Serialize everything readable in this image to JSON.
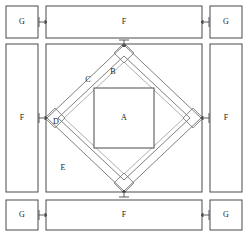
{
  "diagram": {
    "stroke_color": "#4a4a4a",
    "accent_color": "#8a8a8a",
    "background_color": "#ffffff",
    "regions": [
      {
        "id": "A",
        "label": "A",
        "role": "inner-square",
        "x": 124,
        "y": 118
      },
      {
        "id": "B",
        "label": "B",
        "role": "triangle-upper",
        "x": 113,
        "y": 72
      },
      {
        "id": "C",
        "label": "C",
        "role": "band-segment",
        "x": 88,
        "y": 80
      },
      {
        "id": "D",
        "label": "D",
        "role": "corner-square-left",
        "x": 56,
        "y": 122
      },
      {
        "id": "E",
        "label": "E",
        "role": "outer-square-corner",
        "x": 63,
        "y": 168
      }
    ],
    "bars": [
      {
        "id": "F-top",
        "label": "F",
        "x": 46,
        "y": 6,
        "w": 156,
        "h": 32
      },
      {
        "id": "F-bottom",
        "label": "F",
        "x": 46,
        "y": 200,
        "w": 156,
        "h": 30
      },
      {
        "id": "F-left",
        "label": "F",
        "x": 6,
        "y": 44,
        "w": 32,
        "h": 148
      },
      {
        "id": "F-right",
        "label": "F",
        "x": 210,
        "y": 44,
        "w": 32,
        "h": 148
      }
    ],
    "corner_boxes": [
      {
        "id": "G-top-left",
        "label": "G",
        "x": 6,
        "y": 6,
        "w": 32,
        "h": 32
      },
      {
        "id": "G-top-right",
        "label": "G",
        "x": 210,
        "y": 6,
        "w": 32,
        "h": 32
      },
      {
        "id": "G-bottom-left",
        "label": "G",
        "x": 6,
        "y": 200,
        "w": 32,
        "h": 30
      },
      {
        "id": "G-bottom-right",
        "label": "G",
        "x": 210,
        "y": 200,
        "w": 32,
        "h": 30
      }
    ],
    "connectors": [
      {
        "id": "conn-top-left",
        "x": 42,
        "y": 22
      },
      {
        "id": "conn-top-right",
        "x": 206,
        "y": 22
      },
      {
        "id": "conn-bottom-left",
        "x": 42,
        "y": 215
      },
      {
        "id": "conn-bottom-right",
        "x": 206,
        "y": 215
      },
      {
        "id": "conn-left-mid",
        "x": 42,
        "y": 118
      },
      {
        "id": "conn-right-mid",
        "x": 206,
        "y": 118
      },
      {
        "id": "conn-top-mid",
        "x": 124,
        "y": 40
      },
      {
        "id": "conn-bottom-mid",
        "x": 124,
        "y": 197
      }
    ]
  }
}
